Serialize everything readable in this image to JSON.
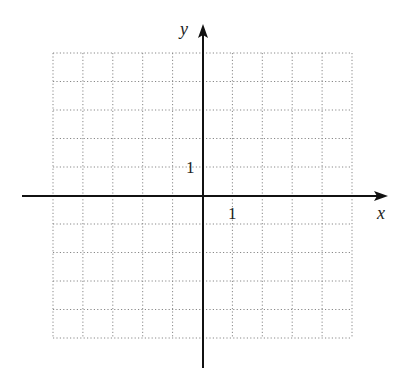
{
  "chart_data": {
    "type": "scatter",
    "title": "",
    "xlabel": "x",
    "ylabel": "y",
    "xlim": [
      -5,
      5
    ],
    "ylim": [
      -5,
      5
    ],
    "grid": true,
    "grid_style": "dotted",
    "tick_labels": {
      "x": [
        "1"
      ],
      "y": [
        "1"
      ]
    },
    "series": [],
    "grid_columns": 10,
    "grid_rows": 10
  },
  "axes": {
    "x_label": "x",
    "y_label": "y",
    "x_tick_label": "1",
    "y_tick_label": "1"
  },
  "colors": {
    "axis": "#111111",
    "grid": "#888888",
    "background": "#ffffff"
  }
}
